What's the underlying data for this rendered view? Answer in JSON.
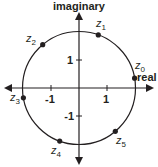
{
  "diagram": {
    "axes": {
      "x_label": "real",
      "y_label": "imaginary"
    },
    "ticks": {
      "x": [
        {
          "value": -1,
          "label": "-1"
        },
        {
          "value": 1,
          "label": "1"
        }
      ],
      "y": [
        {
          "value": 1,
          "label": "1"
        },
        {
          "value": -1,
          "label": "-1"
        }
      ]
    },
    "circle": {
      "radius_units": 2
    },
    "points": [
      {
        "name": "z",
        "sub": "0",
        "angle_deg": 10
      },
      {
        "name": "z",
        "sub": "1",
        "angle_deg": 70
      },
      {
        "name": "z",
        "sub": "2",
        "angle_deg": 130
      },
      {
        "name": "z",
        "sub": "3",
        "angle_deg": 190
      },
      {
        "name": "z",
        "sub": "4",
        "angle_deg": 250
      },
      {
        "name": "z",
        "sub": "5",
        "angle_deg": 310
      }
    ],
    "colors": {
      "ink": "#231f20",
      "background": "#ffffff"
    }
  }
}
